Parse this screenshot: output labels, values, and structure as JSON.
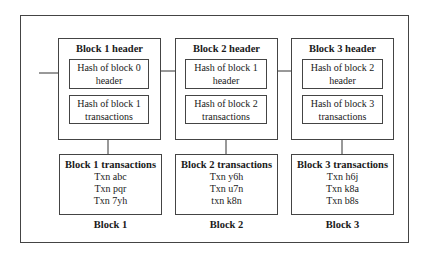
{
  "diagram": {
    "blocks": [
      {
        "header_title": "Block 1 header",
        "prev_hash_line1": "Hash of block 0",
        "prev_hash_line2": "header",
        "tx_hash_line1": "Hash of block 1",
        "tx_hash_line2": "transactions",
        "tx_title": "Block 1 transactions",
        "transactions": [
          "Txn abc",
          "Txn pqr",
          "Txn 7yh"
        ],
        "label": "Block 1"
      },
      {
        "header_title": "Block 2 header",
        "prev_hash_line1": "Hash of block 1",
        "prev_hash_line2": "header",
        "tx_hash_line1": "Hash of block 2",
        "tx_hash_line2": "transactions",
        "tx_title": "Block 2 transactions",
        "transactions": [
          "Txn y6h",
          "Txn u7n",
          "txn k8n"
        ],
        "label": "Block 2"
      },
      {
        "header_title": "Block 3 header",
        "prev_hash_line1": "Hash of block 2",
        "prev_hash_line2": "header",
        "tx_hash_line1": "Hash of block 3",
        "tx_hash_line2": "transactions",
        "tx_title": "Block 3 transactions",
        "transactions": [
          "Txn h6j",
          "Txn k8a",
          "Txn b8s"
        ],
        "label": "Block 3"
      }
    ],
    "colors": {
      "line": "#444444",
      "text": "#1a1a1a",
      "background": "#ffffff"
    }
  }
}
